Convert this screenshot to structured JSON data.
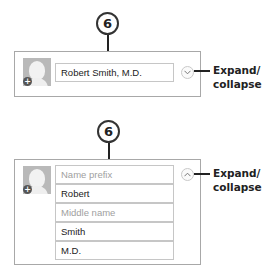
{
  "collapsed": {
    "callout_number": "6",
    "name_field_value": "Robert Smith, M.D.",
    "toggle_icon": "chevron-down-icon",
    "label_line1": "Expand/",
    "label_line2": "collapse"
  },
  "expanded": {
    "callout_number": "6",
    "fields": [
      {
        "value": "Name prefix",
        "placeholder": true
      },
      {
        "value": "Robert",
        "placeholder": false
      },
      {
        "value": "Middle name",
        "placeholder": true
      },
      {
        "value": "Smith",
        "placeholder": false
      },
      {
        "value": "M.D.",
        "placeholder": false
      }
    ],
    "toggle_icon": "chevron-up-icon",
    "label_line1": "Expand/",
    "label_line2": "collapse"
  },
  "colors": {
    "panel_border": "#a8a8a8",
    "field_border": "#c6c6c6",
    "placeholder_text": "#a0a0a0",
    "callout": "#222222"
  }
}
